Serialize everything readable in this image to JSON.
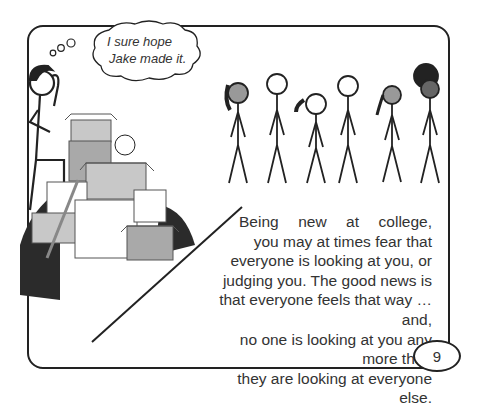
{
  "thought_bubble": {
    "lines": [
      "I sure hope",
      "Jake made it."
    ]
  },
  "body_text": {
    "lines": [
      "Being new at college,",
      "you may at times fear that",
      "everyone is looking at you, or",
      "judging you. The good news is",
      "that everyone feels that way … and,",
      "no one is looking at you any more than",
      "they are looking at everyone else."
    ]
  },
  "page_number": "9",
  "illustration": {
    "left_character": "worried-stick-figure-scratching-head",
    "objects": [
      "stacked-moving-boxes",
      "soccer-ball",
      "book-stack",
      "skateboard",
      "plants",
      "trash-bags"
    ],
    "group": [
      "curly-hair-person",
      "spiky-hair-person",
      "ponytail-person",
      "short-hair-bearded-person",
      "braid-person",
      "afro-person"
    ]
  },
  "colors": {
    "line": "#222222",
    "box_light": "#c8c8c8",
    "box_mid": "#a9a9a9",
    "bag": "#2b2b2b",
    "text": "#333333"
  }
}
